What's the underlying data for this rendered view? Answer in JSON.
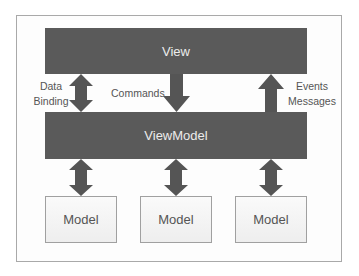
{
  "diagram": {
    "colors": {
      "layer_fill": "#5a5a5a",
      "layer_text": "#ececec",
      "model_border": "#a0a0a0",
      "arrow": "#555555",
      "label_text": "#555555"
    },
    "layers": {
      "view": "View",
      "viewmodel": "ViewModel"
    },
    "models": [
      "Model",
      "Model",
      "Model"
    ],
    "connections": {
      "data_binding": {
        "line1": "Data",
        "line2": "Binding",
        "direction": "bidirectional"
      },
      "commands": {
        "label": "Commands",
        "direction": "view-to-viewmodel"
      },
      "events": {
        "line1": "Events",
        "line2": "Messages",
        "direction": "viewmodel-to-view"
      },
      "model_links": "bidirectional"
    }
  }
}
